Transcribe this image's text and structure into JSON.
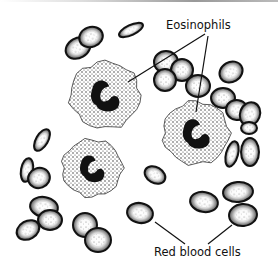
{
  "figure": {
    "labels": {
      "eosinophils": "Eosinophils",
      "red_blood_cells": "Red blood cells"
    },
    "colors": {
      "ink": "#111111",
      "background": "#ffffff"
    },
    "eosinophils": [
      {
        "cx": 105,
        "cy": 95,
        "r": 35
      },
      {
        "cx": 196,
        "cy": 133,
        "r": 33
      },
      {
        "cx": 92,
        "cy": 168,
        "r": 30
      }
    ],
    "red_blood_cells": [
      {
        "cx": 78,
        "cy": 48,
        "rx": 13,
        "ry": 10,
        "rot": -30
      },
      {
        "cx": 91,
        "cy": 37,
        "rx": 12,
        "ry": 10,
        "rot": -20
      },
      {
        "cx": 131,
        "cy": 30,
        "rx": 13,
        "ry": 5,
        "rot": -25
      },
      {
        "cx": 166,
        "cy": 62,
        "rx": 12,
        "ry": 11,
        "rot": 0
      },
      {
        "cx": 182,
        "cy": 70,
        "rx": 11,
        "ry": 11,
        "rot": 0
      },
      {
        "cx": 165,
        "cy": 80,
        "rx": 11,
        "ry": 11,
        "rot": 0
      },
      {
        "cx": 198,
        "cy": 86,
        "rx": 12,
        "ry": 11,
        "rot": 0
      },
      {
        "cx": 223,
        "cy": 98,
        "rx": 12,
        "ry": 10,
        "rot": 0
      },
      {
        "cx": 231,
        "cy": 72,
        "rx": 12,
        "ry": 10,
        "rot": -30
      },
      {
        "cx": 237,
        "cy": 110,
        "rx": 11,
        "ry": 10,
        "rot": 10
      },
      {
        "cx": 250,
        "cy": 114,
        "rx": 10,
        "ry": 12,
        "rot": 20
      },
      {
        "cx": 42,
        "cy": 140,
        "rx": 6,
        "ry": 12,
        "rot": 30
      },
      {
        "cx": 27,
        "cy": 170,
        "rx": 6,
        "ry": 12,
        "rot": 10
      },
      {
        "cx": 39,
        "cy": 178,
        "rx": 11,
        "ry": 10,
        "rot": -20
      },
      {
        "cx": 44,
        "cy": 207,
        "rx": 14,
        "ry": 10,
        "rot": 10
      },
      {
        "cx": 50,
        "cy": 220,
        "rx": 12,
        "ry": 10,
        "rot": 0
      },
      {
        "cx": 28,
        "cy": 230,
        "rx": 12,
        "ry": 9,
        "rot": -30
      },
      {
        "cx": 85,
        "cy": 225,
        "rx": 12,
        "ry": 12,
        "rot": 0
      },
      {
        "cx": 98,
        "cy": 240,
        "rx": 13,
        "ry": 12,
        "rot": 0
      },
      {
        "cx": 155,
        "cy": 175,
        "rx": 11,
        "ry": 8,
        "rot": 30
      },
      {
        "cx": 140,
        "cy": 213,
        "rx": 13,
        "ry": 10,
        "rot": 10
      },
      {
        "cx": 204,
        "cy": 202,
        "rx": 14,
        "ry": 10,
        "rot": 10
      },
      {
        "cx": 238,
        "cy": 192,
        "rx": 15,
        "ry": 10,
        "rot": -5
      },
      {
        "cx": 243,
        "cy": 215,
        "rx": 14,
        "ry": 11,
        "rot": -5
      },
      {
        "cx": 232,
        "cy": 154,
        "rx": 6,
        "ry": 13,
        "rot": 15
      },
      {
        "cx": 250,
        "cy": 152,
        "rx": 9,
        "ry": 14,
        "rot": 0
      },
      {
        "cx": 249,
        "cy": 128,
        "rx": 8,
        "ry": 6,
        "rot": 0
      }
    ]
  }
}
